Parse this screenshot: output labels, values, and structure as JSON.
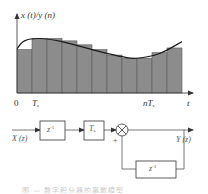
{
  "chart_data": {
    "type": "bar",
    "title": "",
    "ylabel": "x (t)/y (n)",
    "xlabel": "t",
    "x_tick_labels": [
      "0",
      "T_s",
      "nT_s"
    ],
    "categories": [
      "1",
      "2",
      "3",
      "4",
      "5",
      "6",
      "7",
      "8",
      "9",
      "10",
      "11"
    ],
    "values": [
      0.55,
      0.69,
      0.69,
      0.66,
      0.61,
      0.55,
      0.48,
      0.44,
      0.44,
      0.51,
      0.57
    ],
    "overlay_curve": {
      "description": "continuous signal x(t) drawn over sample bars",
      "points": [
        [
          0,
          0.56
        ],
        [
          0.5,
          0.66
        ],
        [
          1.5,
          0.69
        ],
        [
          3,
          0.65
        ],
        [
          5,
          0.55
        ],
        [
          7,
          0.46
        ],
        [
          8,
          0.44
        ],
        [
          9.5,
          0.5
        ],
        [
          11,
          0.65
        ]
      ]
    },
    "grid": false,
    "legend": null
  },
  "plot": {
    "y_axis_label": "x (t)/y (n)",
    "x_axis_label": "t",
    "origin_label": "0",
    "tick_ts": "T",
    "tick_ts_sub": "s",
    "tick_nts_prefix": "nT",
    "tick_nts_sub": "s",
    "bar_color": "#8c8c8c",
    "bar_edge_color": "#5a5a5a",
    "curve_color": "#1a1a1a"
  },
  "block_diagram": {
    "input_label": "X (z)",
    "output_label": "Y (z)",
    "delay_block_1": {
      "base": "z",
      "exp": "-1"
    },
    "gain_block": {
      "base": "T",
      "sub": "s"
    },
    "summing_junction_sign": "+",
    "feedback_delay_block": {
      "base": "z",
      "exp": "-1"
    },
    "line_color": "#555555"
  },
  "caption": {
    "text": "图 — 数字积分器的离散模型"
  }
}
